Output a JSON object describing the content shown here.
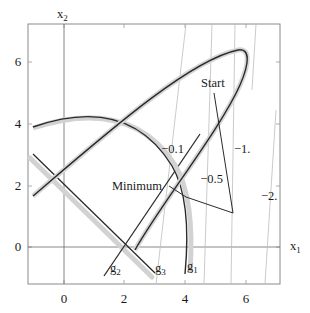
{
  "figure": {
    "type": "constrained optimization contour diagram",
    "axes": {
      "x_label": "x",
      "x_label_sub": "1",
      "y_label": "x",
      "y_label_sub": "2",
      "x_ticks": [
        "0",
        "2",
        "4",
        "6"
      ],
      "y_ticks": [
        "0",
        "2",
        "4",
        "6"
      ],
      "xlim": [
        -1.2,
        7.2
      ],
      "ylim": [
        -1.2,
        7.2
      ]
    },
    "constraints": [
      {
        "name": "g",
        "sub": "1",
        "shape": "ellipse boundary"
      },
      {
        "name": "g",
        "sub": "2",
        "shape": "line"
      },
      {
        "name": "g",
        "sub": "3",
        "shape": "line"
      }
    ],
    "contours": [
      {
        "label": "−0.1"
      },
      {
        "label": "−0.5"
      },
      {
        "label": "−1."
      },
      {
        "label": "−2."
      }
    ],
    "annotations": {
      "start": "Start",
      "minimum": "Minimum"
    },
    "colors": {
      "curve": "#2a2a2a",
      "shade": "#cfcfcf",
      "contour": "#b8b8b8",
      "axis": "#555555",
      "frame": "#888888"
    }
  }
}
